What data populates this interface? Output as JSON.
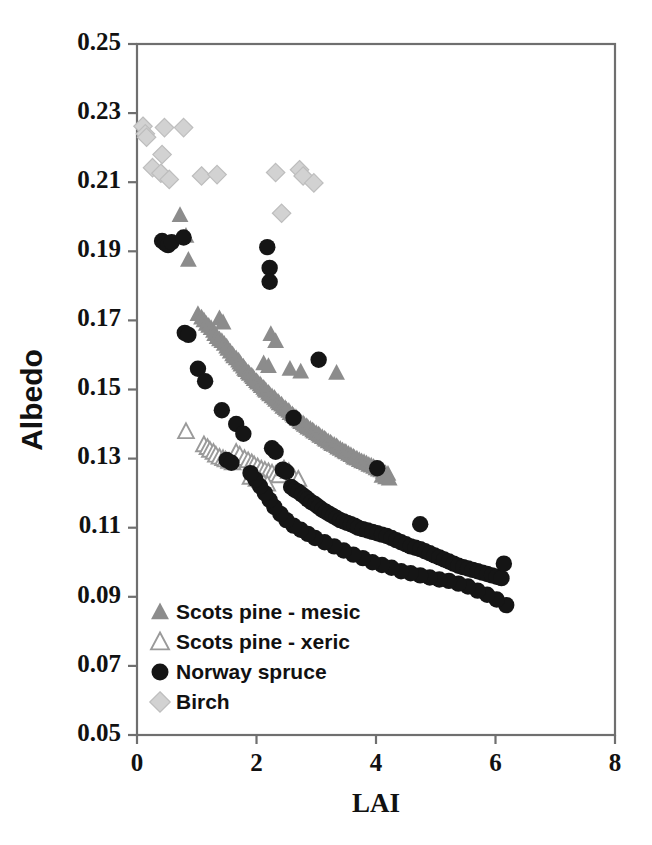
{
  "chart_data": {
    "type": "scatter",
    "title": "",
    "xlabel": "LAI",
    "ylabel": "Albedo",
    "xlim": [
      0,
      8
    ],
    "ylim": [
      0.05,
      0.25
    ],
    "xticks": [
      "0",
      "2",
      "4",
      "6",
      "8"
    ],
    "xtick_values": [
      0,
      2,
      4,
      6,
      8
    ],
    "yticks": [
      "0.05",
      "0.07",
      "0.09",
      "0.11",
      "0.13",
      "0.15",
      "0.17",
      "0.19",
      "0.21",
      "0.23",
      "0.25"
    ],
    "ytick_values": [
      0.05,
      0.07,
      0.09,
      0.11,
      0.13,
      0.15,
      0.17,
      0.19,
      0.21,
      0.23,
      0.25
    ],
    "grid": false,
    "legend_position": "lower-left-inside",
    "colors": {
      "scots_pine_mesic": "#8c8c8c",
      "scots_pine_xeric": "#9a9a9a",
      "norway_spruce": "#151515",
      "birch": "#d2d2d2",
      "axis": "#6f6f6f",
      "text": "#111111",
      "background": "#ffffff"
    },
    "series": [
      {
        "name": "Scots pine - mesic",
        "marker": "triangle-filled",
        "color": "#8c8c8c",
        "points": [
          [
            0.72,
            0.2005
          ],
          [
            0.82,
            0.1945
          ],
          [
            0.86,
            0.1875
          ],
          [
            1.02,
            0.1718
          ],
          [
            1.08,
            0.1708
          ],
          [
            1.12,
            0.17
          ],
          [
            1.16,
            0.169
          ],
          [
            1.2,
            0.1684
          ],
          [
            1.24,
            0.1678
          ],
          [
            1.28,
            0.167
          ],
          [
            1.3,
            0.166
          ],
          [
            1.34,
            0.1652
          ],
          [
            1.38,
            0.1645
          ],
          [
            1.42,
            0.164
          ],
          [
            1.46,
            0.1632
          ],
          [
            1.5,
            0.1624
          ],
          [
            1.52,
            0.1618
          ],
          [
            1.56,
            0.161
          ],
          [
            1.6,
            0.1602
          ],
          [
            1.62,
            0.1596
          ],
          [
            1.66,
            0.159
          ],
          [
            1.7,
            0.1584
          ],
          [
            1.72,
            0.1578
          ],
          [
            1.74,
            0.1572
          ],
          [
            1.78,
            0.1566
          ],
          [
            1.8,
            0.156
          ],
          [
            1.82,
            0.1556
          ],
          [
            1.86,
            0.155
          ],
          [
            1.88,
            0.1545
          ],
          [
            1.92,
            0.154
          ],
          [
            1.94,
            0.1536
          ],
          [
            1.96,
            0.153
          ],
          [
            2.0,
            0.1524
          ],
          [
            2.02,
            0.152
          ],
          [
            2.06,
            0.1515
          ],
          [
            2.08,
            0.151
          ],
          [
            2.12,
            0.1505
          ],
          [
            2.14,
            0.15
          ],
          [
            2.16,
            0.1496
          ],
          [
            2.2,
            0.149
          ],
          [
            2.22,
            0.1486
          ],
          [
            2.26,
            0.148
          ],
          [
            2.3,
            0.1476
          ],
          [
            2.32,
            0.147
          ],
          [
            2.36,
            0.1465
          ],
          [
            2.38,
            0.146
          ],
          [
            2.42,
            0.1456
          ],
          [
            2.44,
            0.145
          ],
          [
            2.48,
            0.1446
          ],
          [
            2.5,
            0.1442
          ],
          [
            2.54,
            0.1438
          ],
          [
            2.56,
            0.1432
          ],
          [
            2.6,
            0.1428
          ],
          [
            2.62,
            0.1424
          ],
          [
            2.66,
            0.142
          ],
          [
            2.68,
            0.1415
          ],
          [
            2.72,
            0.141
          ],
          [
            2.74,
            0.1406
          ],
          [
            2.78,
            0.1402
          ],
          [
            2.8,
            0.1398
          ],
          [
            2.84,
            0.1394
          ],
          [
            2.86,
            0.139
          ],
          [
            2.9,
            0.1386
          ],
          [
            2.94,
            0.1382
          ],
          [
            2.96,
            0.1378
          ],
          [
            3.0,
            0.1374
          ],
          [
            3.04,
            0.137
          ],
          [
            3.06,
            0.1366
          ],
          [
            3.1,
            0.1362
          ],
          [
            3.14,
            0.1358
          ],
          [
            3.16,
            0.1354
          ],
          [
            3.2,
            0.135
          ],
          [
            3.24,
            0.1346
          ],
          [
            3.26,
            0.1342
          ],
          [
            3.3,
            0.134
          ],
          [
            3.34,
            0.1336
          ],
          [
            3.36,
            0.1332
          ],
          [
            3.4,
            0.1328
          ],
          [
            3.44,
            0.1324
          ],
          [
            3.48,
            0.132
          ],
          [
            3.5,
            0.1318
          ],
          [
            3.54,
            0.1314
          ],
          [
            3.58,
            0.131
          ],
          [
            3.62,
            0.1306
          ],
          [
            3.64,
            0.1302
          ],
          [
            3.68,
            0.13
          ],
          [
            3.72,
            0.1296
          ],
          [
            3.76,
            0.1292
          ],
          [
            3.8,
            0.129
          ],
          [
            3.84,
            0.1286
          ],
          [
            3.88,
            0.1282
          ],
          [
            3.92,
            0.128
          ],
          [
            3.96,
            0.1276
          ],
          [
            4.0,
            0.1272
          ],
          [
            4.04,
            0.1268
          ],
          [
            4.08,
            0.1266
          ],
          [
            4.12,
            0.1262
          ],
          [
            4.16,
            0.1258
          ],
          [
            4.2,
            0.1256
          ],
          [
            2.24,
            0.166
          ],
          [
            2.32,
            0.164
          ],
          [
            2.56,
            0.156
          ],
          [
            2.74,
            0.1552
          ],
          [
            3.34,
            0.1548
          ],
          [
            1.38,
            0.1706
          ],
          [
            1.44,
            0.1694
          ],
          [
            2.12,
            0.1576
          ],
          [
            2.2,
            0.1568
          ],
          [
            4.1,
            0.125
          ],
          [
            4.16,
            0.1246
          ],
          [
            4.22,
            0.1242
          ]
        ]
      },
      {
        "name": "Scots pine - xeric",
        "marker": "triangle-open",
        "color": "#9a9a9a",
        "points": [
          [
            0.82,
            0.1378
          ],
          [
            1.12,
            0.134
          ],
          [
            1.18,
            0.1332
          ],
          [
            1.22,
            0.1324
          ],
          [
            1.28,
            0.1318
          ],
          [
            1.32,
            0.131
          ],
          [
            1.38,
            0.1304
          ],
          [
            1.44,
            0.13
          ],
          [
            1.48,
            0.1296
          ],
          [
            1.54,
            0.1292
          ],
          [
            1.6,
            0.1288
          ],
          [
            1.66,
            0.1318
          ],
          [
            1.72,
            0.131
          ],
          [
            1.8,
            0.13
          ],
          [
            1.86,
            0.1294
          ],
          [
            1.92,
            0.1288
          ],
          [
            1.96,
            0.1282
          ],
          [
            2.02,
            0.1276
          ],
          [
            2.08,
            0.127
          ],
          [
            2.14,
            0.1266
          ],
          [
            2.2,
            0.1262
          ],
          [
            2.26,
            0.1258
          ],
          [
            2.32,
            0.1254
          ],
          [
            2.38,
            0.125
          ],
          [
            2.46,
            0.127
          ],
          [
            2.54,
            0.1262
          ],
          [
            2.62,
            0.1246
          ],
          [
            2.7,
            0.124
          ],
          [
            1.9,
            0.1246
          ],
          [
            2.0,
            0.124
          ],
          [
            2.06,
            0.1236
          ],
          [
            2.12,
            0.123
          ],
          [
            2.18,
            0.1226
          ]
        ]
      },
      {
        "name": "Norway spruce",
        "marker": "circle-filled",
        "color": "#151515",
        "points": [
          [
            0.42,
            0.193
          ],
          [
            0.48,
            0.1922
          ],
          [
            0.52,
            0.1918
          ],
          [
            0.58,
            0.1926
          ],
          [
            0.78,
            0.194
          ],
          [
            2.18,
            0.1912
          ],
          [
            2.22,
            0.1852
          ],
          [
            2.22,
            0.1812
          ],
          [
            0.8,
            0.1664
          ],
          [
            0.86,
            0.1658
          ],
          [
            3.04,
            0.1586
          ],
          [
            1.02,
            0.156
          ],
          [
            1.14,
            0.1524
          ],
          [
            1.42,
            0.144
          ],
          [
            2.62,
            0.1418
          ],
          [
            1.66,
            0.14
          ],
          [
            1.78,
            0.1372
          ],
          [
            1.5,
            0.1296
          ],
          [
            1.58,
            0.1288
          ],
          [
            4.02,
            0.1272
          ],
          [
            2.26,
            0.133
          ],
          [
            2.32,
            0.132
          ],
          [
            2.44,
            0.1268
          ],
          [
            2.5,
            0.1262
          ],
          [
            2.58,
            0.1218
          ],
          [
            2.64,
            0.121
          ],
          [
            2.7,
            0.1204
          ],
          [
            2.76,
            0.1196
          ],
          [
            2.82,
            0.1188
          ],
          [
            2.86,
            0.1182
          ],
          [
            2.92,
            0.1174
          ],
          [
            2.98,
            0.1168
          ],
          [
            3.04,
            0.116
          ],
          [
            3.1,
            0.1152
          ],
          [
            3.16,
            0.1146
          ],
          [
            3.22,
            0.114
          ],
          [
            3.28,
            0.1134
          ],
          [
            3.34,
            0.1128
          ],
          [
            3.4,
            0.1122
          ],
          [
            3.46,
            0.1118
          ],
          [
            3.52,
            0.1114
          ],
          [
            3.58,
            0.111
          ],
          [
            3.64,
            0.1106
          ],
          [
            3.7,
            0.11
          ],
          [
            3.78,
            0.1096
          ],
          [
            3.86,
            0.1092
          ],
          [
            3.94,
            0.1088
          ],
          [
            4.02,
            0.1084
          ],
          [
            4.1,
            0.108
          ],
          [
            4.18,
            0.1076
          ],
          [
            4.26,
            0.107
          ],
          [
            4.34,
            0.1064
          ],
          [
            4.42,
            0.1058
          ],
          [
            4.5,
            0.1052
          ],
          [
            4.58,
            0.1046
          ],
          [
            4.66,
            0.1042
          ],
          [
            4.74,
            0.111
          ],
          [
            4.74,
            0.1038
          ],
          [
            4.82,
            0.1032
          ],
          [
            4.9,
            0.1026
          ],
          [
            4.98,
            0.102
          ],
          [
            5.06,
            0.1014
          ],
          [
            5.14,
            0.1008
          ],
          [
            5.22,
            0.1002
          ],
          [
            5.3,
            0.0996
          ],
          [
            5.38,
            0.099
          ],
          [
            5.46,
            0.0986
          ],
          [
            5.54,
            0.0982
          ],
          [
            5.62,
            0.0978
          ],
          [
            5.7,
            0.0974
          ],
          [
            5.78,
            0.097
          ],
          [
            5.86,
            0.0966
          ],
          [
            5.94,
            0.0962
          ],
          [
            6.02,
            0.0958
          ],
          [
            6.1,
            0.0954
          ],
          [
            6.14,
            0.0996
          ],
          [
            6.18,
            0.0876
          ],
          [
            6.02,
            0.0892
          ],
          [
            5.86,
            0.0906
          ],
          [
            5.7,
            0.0918
          ],
          [
            5.54,
            0.093
          ],
          [
            5.38,
            0.0938
          ],
          [
            5.22,
            0.0946
          ],
          [
            5.06,
            0.095
          ],
          [
            4.9,
            0.0956
          ],
          [
            4.74,
            0.0962
          ],
          [
            4.58,
            0.0968
          ],
          [
            4.42,
            0.0974
          ],
          [
            4.26,
            0.0984
          ],
          [
            4.1,
            0.0992
          ],
          [
            3.94,
            0.1
          ],
          [
            3.78,
            0.1012
          ],
          [
            3.62,
            0.1022
          ],
          [
            3.46,
            0.1034
          ],
          [
            3.3,
            0.1046
          ],
          [
            3.14,
            0.1058
          ],
          [
            2.98,
            0.107
          ],
          [
            2.86,
            0.1082
          ],
          [
            2.74,
            0.1094
          ],
          [
            2.62,
            0.1106
          ],
          [
            2.5,
            0.1122
          ],
          [
            2.4,
            0.114
          ],
          [
            2.3,
            0.116
          ],
          [
            2.22,
            0.118
          ],
          [
            2.14,
            0.12
          ],
          [
            2.06,
            0.122
          ],
          [
            1.98,
            0.124
          ],
          [
            1.9,
            0.1258
          ]
        ]
      },
      {
        "name": "Birch",
        "marker": "diamond",
        "color": "#d2d2d2",
        "points": [
          [
            0.1,
            0.2262
          ],
          [
            0.14,
            0.224
          ],
          [
            0.16,
            0.223
          ],
          [
            0.46,
            0.2258
          ],
          [
            0.78,
            0.2258
          ],
          [
            0.42,
            0.218
          ],
          [
            0.26,
            0.2142
          ],
          [
            0.4,
            0.2126
          ],
          [
            0.54,
            0.2108
          ],
          [
            1.08,
            0.2118
          ],
          [
            1.34,
            0.2122
          ],
          [
            2.32,
            0.2128
          ],
          [
            2.72,
            0.2136
          ],
          [
            2.78,
            0.2118
          ],
          [
            2.96,
            0.2098
          ],
          [
            2.42,
            0.201
          ]
        ]
      }
    ]
  },
  "legend": {
    "items": [
      {
        "label": "Scots pine - mesic",
        "marker": "triangle-filled"
      },
      {
        "label": "Scots pine - xeric",
        "marker": "triangle-open"
      },
      {
        "label": "Norway spruce",
        "marker": "circle-filled"
      },
      {
        "label": "Birch",
        "marker": "diamond"
      }
    ]
  }
}
